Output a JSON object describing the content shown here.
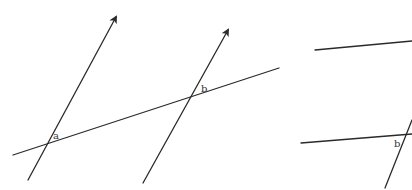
{
  "diagram": {
    "stroke_color": "#2a2a2a",
    "left_figure": {
      "lines": [
        {
          "name": "transversal-a",
          "x1": 28,
          "y1": 180,
          "x2": 116,
          "y2": 17,
          "arrow": true
        },
        {
          "name": "main-line",
          "x1": 13,
          "y1": 155,
          "x2": 279,
          "y2": 68,
          "arrow": false
        },
        {
          "name": "transversal-b",
          "x1": 143,
          "y1": 183,
          "x2": 228,
          "y2": 30,
          "arrow": true
        }
      ],
      "labels": [
        {
          "name": "angle-a",
          "text": "a",
          "x": 53,
          "y": 139
        },
        {
          "name": "angle-b",
          "text": "b",
          "x": 201,
          "y": 92
        }
      ]
    },
    "right_figure": {
      "lines": [
        {
          "name": "upper-line",
          "x1": 315,
          "y1": 50,
          "x2": 412,
          "y2": 41
        },
        {
          "name": "lower-line",
          "x1": 301,
          "y1": 143,
          "x2": 412,
          "y2": 134
        },
        {
          "name": "steep-transversal",
          "x1": 385,
          "y1": 188,
          "x2": 412,
          "y2": 120
        }
      ],
      "labels": [
        {
          "name": "angle-b-right",
          "text": "b",
          "x": 394,
          "y": 147
        }
      ]
    }
  }
}
